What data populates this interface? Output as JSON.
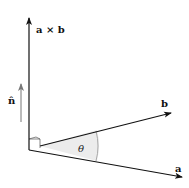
{
  "diagram": {
    "labels": {
      "cross": "a × b",
      "normal": "n̂",
      "b": "b",
      "a": "a",
      "theta": "θ"
    },
    "colors": {
      "axis": "#111111",
      "normal_arrow": "#777777",
      "angle_fill": "#ececec"
    }
  }
}
